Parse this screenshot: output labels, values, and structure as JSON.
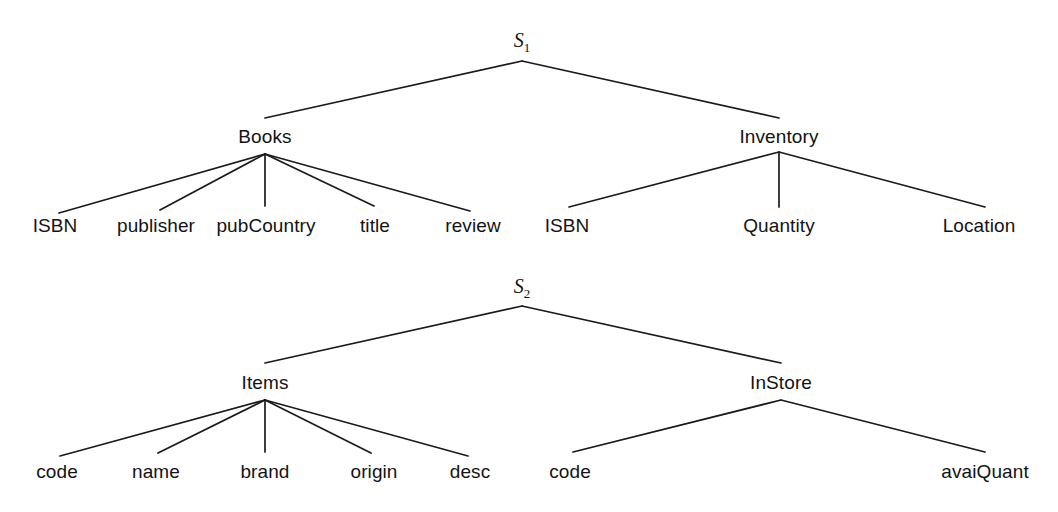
{
  "diagram": {
    "type": "schema-tree-pair",
    "background_color": "#ffffff",
    "line_color": "#1a1a1a",
    "text_color": "#131313",
    "trees": [
      {
        "id": "s1",
        "root": {
          "label": "S",
          "subscript": "1",
          "x": 522,
          "y": 42
        },
        "apex": {
          "x": 522,
          "y": 61
        },
        "children": [
          {
            "label": "Books",
            "x": 265,
            "y": 136,
            "apex_y": 154,
            "edge_end_y": 118,
            "leaves": [
              {
                "label": "ISBN",
                "x": 55,
                "y": 225,
                "edge_x": 59,
                "edge_y": 213
              },
              {
                "label": "publisher",
                "x": 156,
                "y": 225,
                "edge_x": 160,
                "edge_y": 210
              },
              {
                "label": "pubCountry",
                "x": 266,
                "y": 225,
                "edge_x": 265,
                "edge_y": 206
              },
              {
                "label": "title",
                "x": 375,
                "y": 225,
                "edge_x": 374,
                "edge_y": 206
              },
              {
                "label": "review",
                "x": 473,
                "y": 225,
                "edge_x": 470,
                "edge_y": 211
              }
            ]
          },
          {
            "label": "Inventory",
            "x": 779,
            "y": 136,
            "apex_y": 152,
            "edge_end_y": 118,
            "leaves": [
              {
                "label": "ISBN",
                "x": 567,
                "y": 225,
                "edge_x": 569,
                "edge_y": 207
              },
              {
                "label": "Quantity",
                "x": 779,
                "y": 225,
                "edge_x": 779,
                "edge_y": 207
              },
              {
                "label": "Location",
                "x": 979,
                "y": 225,
                "edge_x": 985,
                "edge_y": 207
              }
            ]
          }
        ]
      },
      {
        "id": "s2",
        "root": {
          "label": "S",
          "subscript": "2",
          "x": 522,
          "y": 288
        },
        "apex": {
          "x": 522,
          "y": 306
        },
        "children": [
          {
            "label": "Items",
            "x": 265,
            "y": 382,
            "apex_y": 400,
            "edge_end_y": 363,
            "leaves": [
              {
                "label": "code",
                "x": 57,
                "y": 471,
                "edge_x": 60,
                "edge_y": 456
              },
              {
                "label": "name",
                "x": 156,
                "y": 471,
                "edge_x": 158,
                "edge_y": 453
              },
              {
                "label": "brand",
                "x": 265,
                "y": 471,
                "edge_x": 265,
                "edge_y": 452
              },
              {
                "label": "origin",
                "x": 374,
                "y": 471,
                "edge_x": 371,
                "edge_y": 453
              },
              {
                "label": "desc",
                "x": 470,
                "y": 471,
                "edge_x": 468,
                "edge_y": 456
              }
            ]
          },
          {
            "label": "InStore",
            "x": 781,
            "y": 382,
            "apex_y": 400,
            "edge_end_y": 363,
            "leaves": [
              {
                "label": "code",
                "x": 570,
                "y": 471,
                "edge_x": 573,
                "edge_y": 452
              },
              {
                "label": "avaiQuant",
                "x": 985,
                "y": 471,
                "edge_x": 985,
                "edge_y": 452
              }
            ]
          }
        ]
      }
    ]
  }
}
